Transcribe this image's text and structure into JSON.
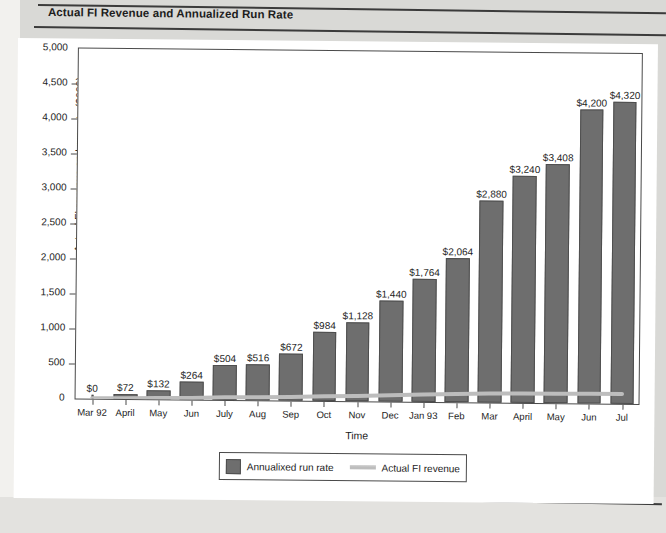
{
  "page": {
    "title": "Actual FI Revenue and Annualized Run Rate"
  },
  "chart_data": {
    "type": "bar",
    "title": "Actual FI Revenue and Annualized Run Rate",
    "xlabel": "Time",
    "ylabel": "Actual FI revenue and run rate ($000)",
    "ylim": [
      0,
      5000
    ],
    "ytick_labels": [
      "5,000",
      "4,500",
      "4,000",
      "3,500",
      "3,000",
      "2,500",
      "2,000",
      "1,500",
      "1,000",
      "500",
      "0"
    ],
    "ytick_values": [
      5000,
      4500,
      4000,
      3500,
      3000,
      2500,
      2000,
      1500,
      1000,
      500,
      0
    ],
    "grid": false,
    "legend_position": "bottom",
    "categories": [
      "Mar 92",
      "April",
      "May",
      "Jun",
      "July",
      "Aug",
      "Sep",
      "Oct",
      "Nov",
      "Dec",
      "Jan 93",
      "Feb",
      "Mar",
      "April",
      "May",
      "Jun",
      "Jul"
    ],
    "series": [
      {
        "name": "Annualixed run rate",
        "kind": "bar",
        "values": [
          0,
          72,
          132,
          264,
          504,
          516,
          672,
          984,
          1128,
          1440,
          1764,
          2064,
          2880,
          3240,
          3408,
          4200,
          4320
        ],
        "labels": [
          "$0",
          "$72",
          "$132",
          "$264",
          "$504",
          "$516",
          "$672",
          "$984",
          "$1,128",
          "$1,440",
          "$1,764",
          "$2,064",
          "$2,880",
          "$3,240",
          "$3,408",
          "$4,200",
          "$4,320"
        ],
        "color": "#6e6e6e"
      },
      {
        "name": "Actual FI revenue",
        "kind": "line",
        "values": [
          6,
          12,
          18,
          26,
          38,
          44,
          53,
          65,
          76,
          90,
          104,
          118,
          128,
          134,
          136,
          140,
          142
        ],
        "color": "#bdbdbd"
      }
    ]
  },
  "legend": {
    "bar_label": "Annualixed run rate",
    "line_label": "Actual FI revenue"
  }
}
